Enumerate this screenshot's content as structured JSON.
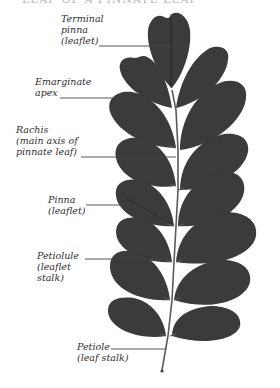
{
  "header": {
    "text": "LEAF OF A PINNATE LEAF"
  },
  "colors": {
    "leaf_fill": "#3a3a3a",
    "leaf_shadow": "#2c2c2c",
    "rachis": "#5a5a5a",
    "leader_line": "#444444",
    "label_text": "#2e2e2e",
    "background": "#ffffff"
  },
  "labels": [
    {
      "id": "terminal-pinna",
      "lines": [
        "Terminal",
        "pinna",
        "(leaflet)"
      ]
    },
    {
      "id": "emarginate-apex",
      "lines": [
        "Emarginate",
        "apex"
      ]
    },
    {
      "id": "rachis",
      "lines": [
        "Rachis",
        "(main axis of",
        "pinnate leaf)"
      ]
    },
    {
      "id": "pinna",
      "lines": [
        "Pinna",
        "(leaflet)"
      ]
    },
    {
      "id": "petiolule",
      "lines": [
        "Petiolule",
        "(leaflet",
        "stalk)"
      ]
    },
    {
      "id": "petiole",
      "lines": [
        "Petiole",
        "(leaf stalk)"
      ]
    }
  ]
}
